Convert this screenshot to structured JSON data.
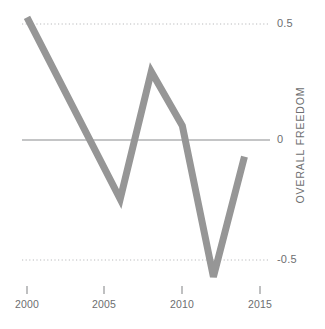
{
  "chart_data": {
    "type": "line",
    "title": "",
    "subtitle": "",
    "xlabel": "",
    "ylabel": "OVERALL FREEDOM",
    "xlim": [
      1999.3,
      2015.6
    ],
    "ylim": [
      -0.68,
      0.6
    ],
    "grid": true,
    "legend": null,
    "x_ticks": [
      2000,
      2005,
      2010,
      2015
    ],
    "x_tick_labels": [
      "2000",
      "2005",
      "2010",
      "2015"
    ],
    "y_ticks": [
      0.5,
      0,
      -0.5
    ],
    "y_tick_labels": [
      "0.5",
      "0",
      "-0.5"
    ],
    "gridlines": [
      {
        "value": 0.5,
        "style": "dotted"
      },
      {
        "value": 0,
        "style": "solid"
      },
      {
        "value": -0.5,
        "style": "dotted"
      }
    ],
    "series": [
      {
        "name": "Overall Freedom",
        "color": "#969696",
        "line_width": 7,
        "x": [
          2000,
          2006,
          2008,
          2010,
          2012,
          2014
        ],
        "values": [
          0.52,
          -0.25,
          0.29,
          0.06,
          -0.58,
          -0.07
        ]
      }
    ]
  },
  "axis": {
    "y_title": "OVERALL FREEDOM",
    "y_labels": [
      "0.5",
      "0",
      "-0.5"
    ],
    "x_labels": [
      "2000",
      "2005",
      "2010",
      "2015"
    ]
  },
  "colors": {
    "line": "#969696",
    "zero_line": "#8a8c8e",
    "gridline": "#b9babc",
    "text": "#6d6e70",
    "background": "#ffffff"
  }
}
